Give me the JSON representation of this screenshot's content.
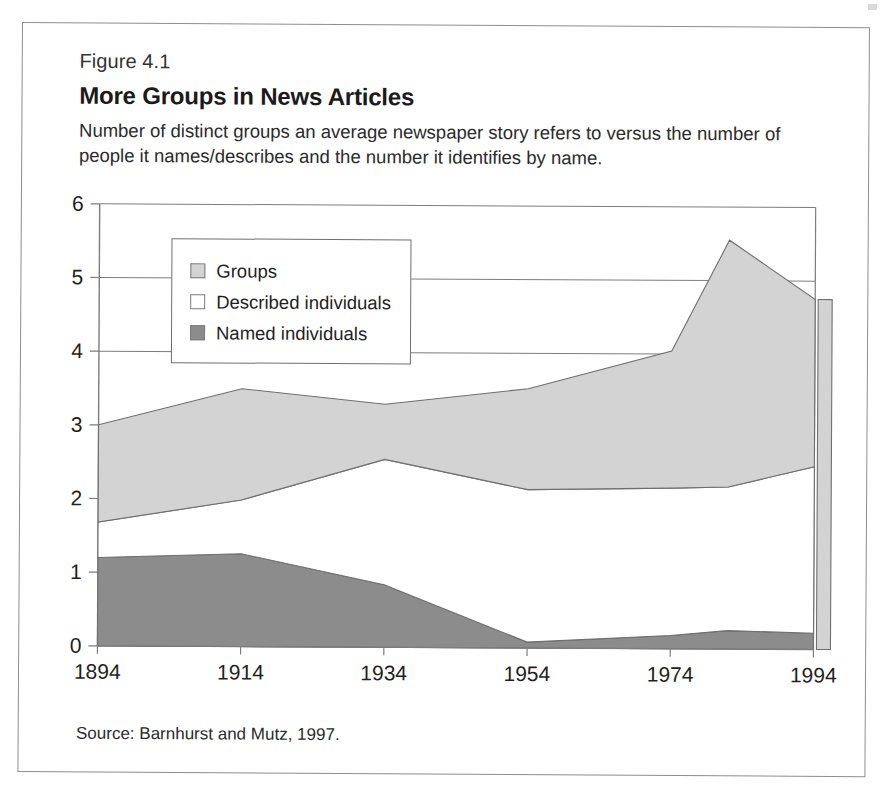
{
  "figure": {
    "label": "Figure 4.1",
    "title": "More Groups in News Articles",
    "subtitle": "Number of distinct groups an average newspaper story refers to versus the number of people it names/describes and the number it identifies by name.",
    "source": "Source: Barnhurst and Mutz, 1997."
  },
  "legend": {
    "position": "inside-top-left",
    "items": [
      {
        "label": "Groups",
        "color": "#d3d3d3",
        "swatch_class": "sw-groups"
      },
      {
        "label": "Described individuals",
        "color": "#ffffff",
        "swatch_class": "sw-described"
      },
      {
        "label": "Named individuals",
        "color": "#8c8c8c",
        "swatch_class": "sw-named"
      }
    ]
  },
  "colors": {
    "groups": "#d3d3d3",
    "described": "#ffffff",
    "named": "#8c8c8c",
    "outline": "#6f6f6f",
    "axis": "#7d7d7d",
    "text": "#231f20"
  },
  "chart_data": {
    "type": "area",
    "stacked": true,
    "title": "More Groups in News Articles",
    "subtitle": "Number of distinct groups an average newspaper story refers to versus the number of people it names/describes and the number it identifies by name.",
    "xlabel": "",
    "ylabel": "",
    "xlim": [
      1894,
      1994
    ],
    "ylim": [
      0,
      6
    ],
    "yticks": [
      0,
      1,
      2,
      3,
      4,
      5,
      6
    ],
    "xticks": [
      1894,
      1914,
      1934,
      1954,
      1974,
      1994
    ],
    "xtick_labels": [
      "1894",
      "1914",
      "1934",
      "1954",
      "1974",
      "1994"
    ],
    "ytick_labels": [
      "0",
      "1",
      "2",
      "3",
      "4",
      "5",
      "6"
    ],
    "grid": "horizontal",
    "legend": [
      "Groups",
      "Described individuals",
      "Named individuals"
    ],
    "x": [
      1894,
      1914,
      1934,
      1954,
      1974,
      1982,
      1994
    ],
    "series": [
      {
        "name": "Named individuals",
        "color": "#8c8c8c",
        "values": [
          1.2,
          1.26,
          0.85,
          0.08,
          0.18,
          0.25,
          0.22
        ]
      },
      {
        "name": "Described individuals",
        "color": "#ffffff",
        "values": [
          0.48,
          0.73,
          1.7,
          2.07,
          2.0,
          1.95,
          2.26
        ]
      },
      {
        "name": "Groups",
        "color": "#d3d3d3",
        "values": [
          1.32,
          1.51,
          0.75,
          1.37,
          1.86,
          3.35,
          2.27
        ]
      }
    ],
    "cumulative_tops": {
      "named": [
        1.2,
        1.26,
        0.85,
        0.08,
        0.18,
        0.25,
        0.22
      ],
      "described": [
        1.68,
        1.99,
        2.55,
        2.15,
        2.18,
        2.2,
        2.48
      ],
      "groups": [
        3.0,
        3.5,
        3.3,
        3.52,
        4.04,
        5.55,
        4.75
      ]
    }
  }
}
